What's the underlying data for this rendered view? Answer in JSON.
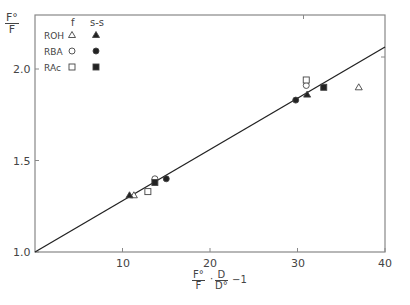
{
  "chart_data": {
    "type": "scatter",
    "title": "",
    "ylabel": "F°/F",
    "xlabel": "F°/F · D/D° − 1",
    "xlim": [
      0,
      40
    ],
    "ylim": [
      1.0,
      2.13
    ],
    "xticks": [
      10,
      20,
      30,
      40
    ],
    "yticks": [
      1.0,
      1.5,
      2.0
    ],
    "ytick_labels": [
      "1.0",
      "1.5",
      "2.0"
    ],
    "xtick_labels": [
      "10",
      "20",
      "30",
      "40"
    ],
    "grid": false,
    "legend": {
      "position": "upper-left",
      "column_headers": [
        "f",
        "s-s"
      ],
      "rows": [
        "ROH",
        "RBA",
        "RAc"
      ]
    },
    "fit_line": {
      "x": [
        0,
        40
      ],
      "y": [
        1.0,
        2.12
      ]
    },
    "series": [
      {
        "name": "ROH f",
        "marker": "triangle-open",
        "points": [
          [
            11.3,
            1.31
          ],
          [
            37.0,
            1.9
          ]
        ]
      },
      {
        "name": "ROH s-s",
        "marker": "triangle-filled",
        "points": [
          [
            10.8,
            1.31
          ],
          [
            31.1,
            1.86
          ]
        ]
      },
      {
        "name": "RBA f",
        "marker": "circle-open",
        "points": [
          [
            13.7,
            1.4
          ],
          [
            31.0,
            1.91
          ]
        ]
      },
      {
        "name": "RBA s-s",
        "marker": "circle-filled",
        "points": [
          [
            15.0,
            1.4
          ],
          [
            29.8,
            1.83
          ]
        ]
      },
      {
        "name": "RAc f",
        "marker": "square-open",
        "points": [
          [
            12.9,
            1.33
          ],
          [
            31.0,
            1.94
          ]
        ]
      },
      {
        "name": "RAc s-s",
        "marker": "square-filled",
        "points": [
          [
            13.7,
            1.38
          ],
          [
            33.0,
            1.9
          ]
        ]
      }
    ]
  },
  "labels": {
    "y_num": "F°",
    "y_den": "F",
    "x_f_num": "F°",
    "x_f_den": "F",
    "x_d_num": "D",
    "x_d_den": "D°",
    "x_suffix": "−1",
    "legend_f": "f",
    "legend_ss": "s-s",
    "legend_rows": [
      "ROH",
      "RBA",
      "RAc"
    ],
    "yticks": [
      "2.0",
      "1.5",
      "1.0"
    ],
    "xticks": [
      "10",
      "20",
      "30",
      "40"
    ]
  }
}
